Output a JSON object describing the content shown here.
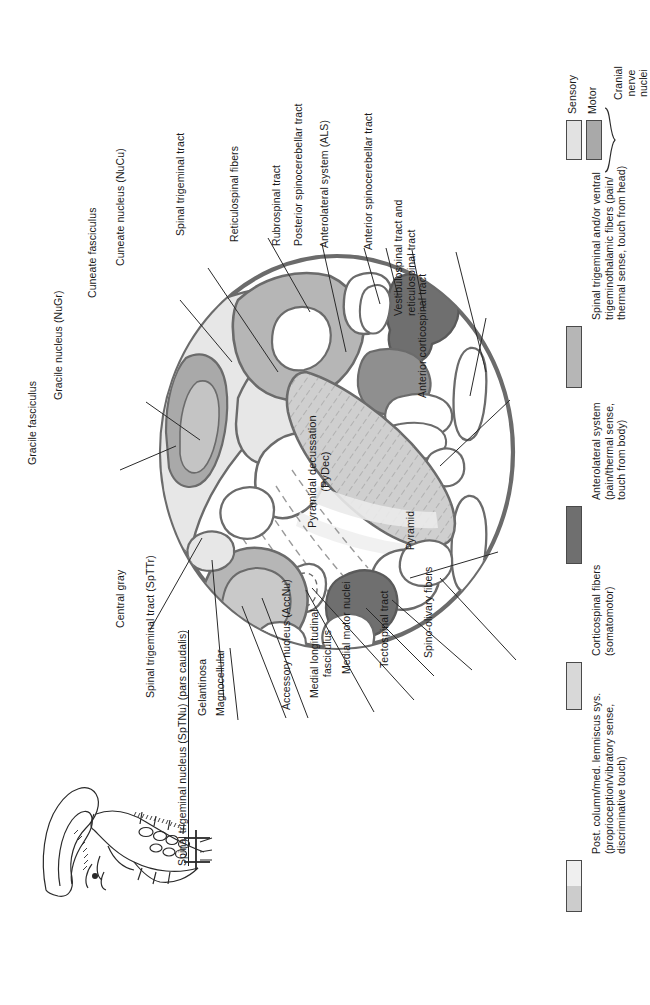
{
  "figure": {
    "region_label": "Pyramidal decussation\n(PyDec)"
  },
  "colors": {
    "outline": "#6b6b6b",
    "thin_outline": "#555555",
    "sensory_light": "#e2e2e2",
    "motor_medium": "#a9a9a9",
    "spinal_trigeminal": "#b6b6b6",
    "anterolateral_dark": "#6f6f6f",
    "corticospinal_light": "#d8d8d8",
    "posterior_column_top": "#efefef",
    "posterior_column_bottom": "#cccccc",
    "white": "#ffffff",
    "text": "#1a1a1a"
  },
  "labels": {
    "gracile_fasciculus": "Gracile fasciculus",
    "gracile_nucleus": "Gracile nucleus (NuGr)",
    "cuneate_fasciculus": "Cuneate fasciculus",
    "cuneate_nucleus": "Cuneate nucleus (NuCu)",
    "spinal_trigeminal_tract_top": "Spinal trigeminal tract",
    "reticulospinal_fibers": "Reticulospinal fibers",
    "rubrospinal_tract": "Rubrospinal tract",
    "posterior_spinocerebellar_tract": "Posterior spinocerebellar tract",
    "anterolateral_system": "Anterolateral system (ALS)",
    "anterior_spinocerebellar_tract": "Anterior spinocerebellar tract",
    "vestibulospinal_reticulospinal": "Vestibulospinal tract and\nreticulospinal tract",
    "anterior_corticospinal_tract": "Anterior corticospinal tract",
    "pyramid": "Pyramid",
    "spino_olivary_fibers": "Spino-olivary fibers",
    "tectospinal_tract": "Tectospinal tract",
    "medial_motor_nuclei": "Medial motor nuclei",
    "medial_longitudinal_fasciculus": "Medial longitudinal\nfasciculus",
    "accessory_nucleus": "Accessory nucleus (AccNu)",
    "magnocellular": "Magnocellular",
    "gelantinosa": "Gelantinosa",
    "spinal_trigeminal_nucleus": "Spinal trigeminal nucleus (SpTNu) (pars caudalis)",
    "spinal_trigeminal_tract_sptr": "Spinal trigeminal tract (SpTTr)",
    "central_gray": "Central gray"
  },
  "legend": {
    "cranial_nerve_nuclei": {
      "group_label": "Cranial\nnerve\nnuclei",
      "items": [
        {
          "label": "Sensory",
          "color": "#e2e2e2"
        },
        {
          "label": "Motor",
          "color": "#a9a9a9"
        }
      ]
    },
    "entries": [
      {
        "label": "Spinal trigeminal and/or ventral\ntrigeminothalamic fibers (pain/\nthermal sense, touch from head)",
        "color": "#b6b6b6",
        "two_tone": false
      },
      {
        "label": "Anterolateral system\n(pain/thermal sense,\ntouch from body)",
        "color": "#6f6f6f",
        "two_tone": false
      },
      {
        "label": "Corticospinal fibers\n(somatomotor)",
        "color": "#d8d8d8",
        "two_tone": false
      },
      {
        "label": "Post. column/med. lemniscus sys.\n(proprioception/vibratory sense,\ndiscriminative touch)",
        "color": "#efefef",
        "color2": "#cccccc",
        "two_tone": true
      }
    ]
  },
  "inset": {
    "name": "brainstem-orientation-inset",
    "description": "Lateral view of brainstem with section plane marker"
  }
}
